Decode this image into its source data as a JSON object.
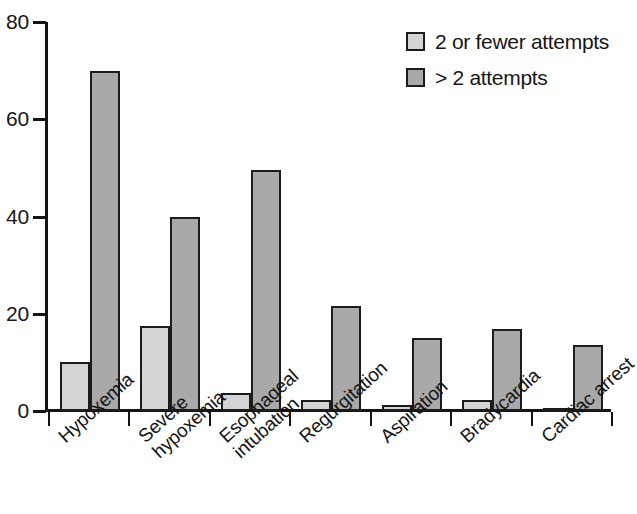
{
  "chart_data": {
    "type": "bar",
    "title": "",
    "xlabel": "",
    "ylabel": "",
    "ylim": [
      0,
      80
    ],
    "yticks": [
      0,
      20,
      40,
      60,
      80
    ],
    "ytick_labels": [
      "0",
      "20",
      "40",
      "60",
      "80"
    ],
    "grid": false,
    "legend_position": "top-right",
    "categories": [
      "Hypoxemia",
      "Severe hypoxemia",
      "Esophageal intubation",
      "Regurgitation",
      "Aspiration",
      "Bradycardia",
      "Cardiac arrest"
    ],
    "category_lines": [
      [
        "Hypoxemia",
        ""
      ],
      [
        "Severe",
        "hypoxemia"
      ],
      [
        "Esophageal",
        "intubation"
      ],
      [
        "Regurgitation",
        ""
      ],
      [
        "Aspiration",
        ""
      ],
      [
        "Bradycardia",
        ""
      ],
      [
        "Cardiac arrest",
        ""
      ]
    ],
    "series": [
      {
        "name": "2 or fewer attempts",
        "color": "#d4d4d4",
        "values": [
          10,
          17.5,
          3.8,
          2.3,
          1.3,
          2.3,
          0.5
        ]
      },
      {
        "name": "> 2 attempts",
        "color": "#a9a9a9",
        "values": [
          70,
          40,
          49.5,
          21.5,
          15,
          16.8,
          13.5
        ]
      }
    ]
  },
  "legend": {
    "items": [
      {
        "label": "2 or fewer attempts",
        "swatch": "series-a"
      },
      {
        "label": "> 2 attempts",
        "swatch": "series-b"
      }
    ]
  }
}
